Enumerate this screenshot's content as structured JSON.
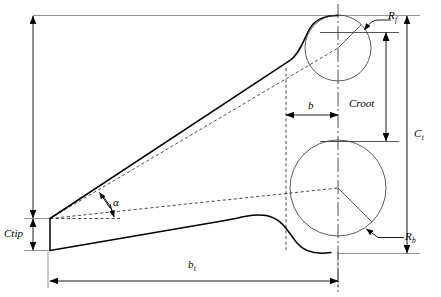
{
  "diagram": {
    "type": "engineering-dimension-drawing",
    "stroke_color": "#000000",
    "thin_stroke_color": "#3a3a3a",
    "background_color": "#ffffff"
  },
  "labels": {
    "r_fillet": {
      "base": "R",
      "sub": "f"
    },
    "r_back": {
      "base": "R",
      "sub": "b"
    },
    "c_root": {
      "base": "C",
      "sub": "root"
    },
    "c_tip": {
      "base": "C",
      "sub": "tip"
    },
    "c_t": {
      "base": "C",
      "sub": "t"
    },
    "b_t": {
      "base": "b",
      "sub": "t"
    },
    "b": {
      "base": "b",
      "sub": ""
    },
    "alpha": {
      "base": "α",
      "sub": ""
    }
  },
  "dimensions": [
    {
      "name": "c-t",
      "label": "C_t",
      "orientation": "vertical",
      "x": 407,
      "y1": 16,
      "y2": 253
    },
    {
      "name": "c-root",
      "label": "C_root",
      "orientation": "vertical",
      "x": 386,
      "y1": 32,
      "y2": 141
    },
    {
      "name": "c-tip",
      "label": "C_tip",
      "orientation": "vertical",
      "x": 31,
      "y1": 218,
      "y2": 250
    },
    {
      "name": "b-t",
      "label": "b_t",
      "orientation": "horizontal",
      "y": 281,
      "x1": 50,
      "x2": 338
    },
    {
      "name": "b",
      "label": "b",
      "orientation": "horizontal",
      "y": 115,
      "x1": 286,
      "x2": 338
    },
    {
      "name": "alpha",
      "label": "α",
      "orientation": "angle",
      "vertex_x": 50,
      "vertex_y": 218
    }
  ],
  "features": [
    {
      "name": "leading-edge-circle",
      "cx": 338,
      "cy": 48,
      "r": 33
    },
    {
      "name": "trailing-edge-circle",
      "cx": 338,
      "cy": 188,
      "r": 48
    },
    {
      "name": "centerline",
      "x": 338,
      "y1": 5,
      "y2": 292
    }
  ]
}
